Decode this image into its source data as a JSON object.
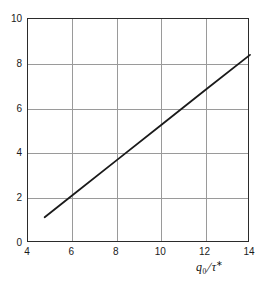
{
  "chart_data": {
    "type": "line",
    "title": "",
    "xlabel": "q_0 / τ*",
    "ylabel": "",
    "xlim": [
      4,
      14
    ],
    "ylim": [
      0,
      10
    ],
    "xticks": [
      4,
      6,
      8,
      10,
      12,
      14
    ],
    "yticks": [
      0,
      2,
      4,
      6,
      8,
      10
    ],
    "xtick_labels": [
      "4",
      "6",
      "8",
      "10",
      "12",
      "14"
    ],
    "ytick_labels": [
      "0",
      "2",
      "4",
      "6",
      "8",
      "10"
    ],
    "grid": true,
    "grid_color": "#9a9a9a",
    "frame_color": "#2b2b2b",
    "legend": null,
    "series": [
      {
        "name": "line",
        "color": "#1a1a1a",
        "x": [
          4.75,
          6,
          8,
          10,
          12,
          14
        ],
        "y": [
          1.15,
          2.13,
          3.7,
          5.27,
          6.84,
          8.4
        ]
      }
    ]
  },
  "axis_title": {
    "numerator": "q",
    "numerator_sub": "0",
    "separator": "/",
    "denominator": "τ",
    "denominator_sup": "∗"
  }
}
